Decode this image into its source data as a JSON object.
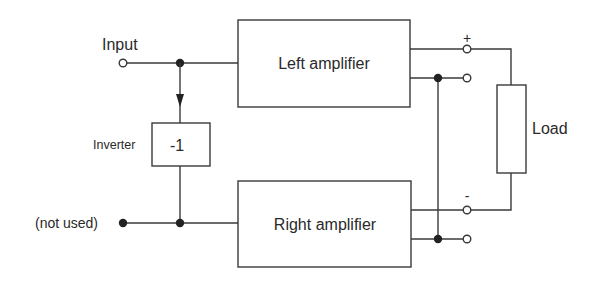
{
  "diagram": {
    "labels": {
      "input": "Input",
      "inverter": "Inverter",
      "inverter_gain": "-1",
      "not_used": "(not used)",
      "left_amplifier": "Left amplifier",
      "right_amplifier": "Right amplifier",
      "load": "Load",
      "plus": "+",
      "minus": "-"
    },
    "colors": {
      "stroke": "#3a3a3a",
      "text": "#2a2a2a",
      "background": "#ffffff"
    },
    "nodes": [
      {
        "id": "input-terminal",
        "type": "open-terminal"
      },
      {
        "id": "input-junction",
        "type": "junction"
      },
      {
        "id": "inverter",
        "type": "block",
        "label": "-1"
      },
      {
        "id": "not-used-terminal",
        "type": "closed-terminal"
      },
      {
        "id": "right-input-junction",
        "type": "junction"
      },
      {
        "id": "left-amplifier",
        "type": "block",
        "label": "Left amplifier"
      },
      {
        "id": "right-amplifier",
        "type": "block",
        "label": "Right amplifier"
      },
      {
        "id": "left-plus-terminal",
        "type": "open-terminal",
        "polarity": "+"
      },
      {
        "id": "left-ground-terminal",
        "type": "open-terminal"
      },
      {
        "id": "right-minus-terminal",
        "type": "open-terminal",
        "polarity": "-"
      },
      {
        "id": "right-ground-terminal",
        "type": "open-terminal"
      },
      {
        "id": "load",
        "type": "block",
        "label": "Load"
      }
    ],
    "edges": [
      {
        "from": "input-terminal",
        "to": "input-junction"
      },
      {
        "from": "input-junction",
        "to": "left-amplifier"
      },
      {
        "from": "input-junction",
        "to": "inverter",
        "arrow": true
      },
      {
        "from": "inverter",
        "to": "right-input-junction"
      },
      {
        "from": "not-used-terminal",
        "to": "right-input-junction"
      },
      {
        "from": "right-input-junction",
        "to": "right-amplifier"
      },
      {
        "from": "left-amplifier",
        "to": "left-plus-terminal"
      },
      {
        "from": "left-amplifier",
        "to": "left-ground-terminal"
      },
      {
        "from": "right-amplifier",
        "to": "right-minus-terminal"
      },
      {
        "from": "right-amplifier",
        "to": "right-ground-terminal"
      },
      {
        "from": "left-ground-terminal",
        "to": "right-ground-terminal"
      },
      {
        "from": "left-plus-terminal",
        "to": "load"
      },
      {
        "from": "load",
        "to": "right-minus-terminal"
      }
    ]
  }
}
